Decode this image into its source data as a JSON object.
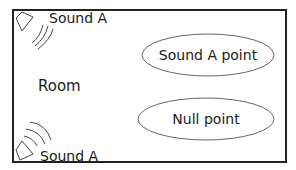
{
  "diagram": {
    "room_label": "Room",
    "sources": [
      {
        "label": "Sound A",
        "position": "top-left"
      },
      {
        "label": "Sound A",
        "position": "bottom-left"
      }
    ],
    "regions": [
      {
        "label": "Sound A point"
      },
      {
        "label": "Null point"
      }
    ],
    "colors": {
      "stroke": "#222222",
      "ellipse_stroke": "#666666",
      "text": "#1a1a1a"
    }
  }
}
